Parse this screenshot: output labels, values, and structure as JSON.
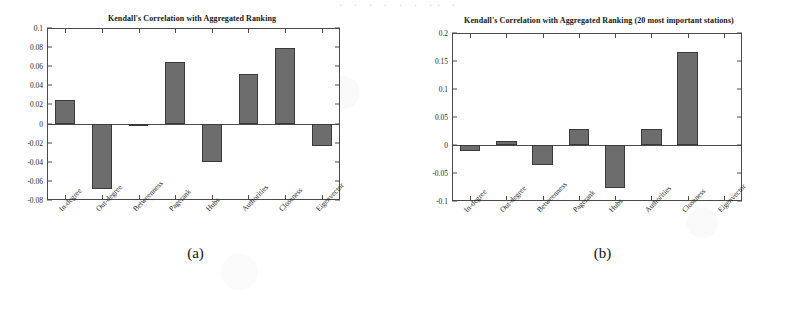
{
  "page": {
    "top_bleed_text": "· · ·  · ·   ·  ·· ·",
    "bar_color": "#6d6d6d",
    "axis_color": "#4a4a4a"
  },
  "panels": [
    {
      "caption": "(a)",
      "chart_data": {
        "type": "bar",
        "title": "Kendall's Correlation with Aggregated Ranking",
        "xlabel": "",
        "ylabel": "",
        "ylim": [
          -0.08,
          0.1
        ],
        "yticks": [
          0.1,
          0.08,
          0.06,
          0.04,
          0.02,
          0,
          -0.02,
          -0.04,
          -0.06,
          -0.08
        ],
        "ytick_labels": [
          "0.1",
          "0.08",
          "0.06",
          "0.04",
          "0.02",
          "0",
          "-0.02",
          "-0.04",
          "-0.06",
          "-0.08"
        ],
        "grid": false,
        "legend": "none",
        "categories": [
          "In-degree",
          "Out-degree",
          "Betweenness",
          "Pagerank",
          "Hubs",
          "Authorities",
          "Closeness",
          "Eigenvector"
        ],
        "values": [
          0.025,
          -0.069,
          -0.0005,
          0.064,
          -0.04,
          0.052,
          0.079,
          -0.024
        ]
      }
    },
    {
      "caption": "(b)",
      "chart_data": {
        "type": "bar",
        "title": "Kendall's Correlation with Aggregated Ranking (20 most important stations)",
        "xlabel": "",
        "ylabel": "",
        "ylim": [
          -0.1,
          0.2
        ],
        "yticks": [
          0.2,
          0.15,
          0.1,
          0.05,
          0,
          -0.05,
          -0.1
        ],
        "ytick_labels": [
          "0.2",
          "0.15",
          "0.1",
          "0.05",
          "0",
          "-0.05",
          "-0.1"
        ],
        "grid": false,
        "legend": "none",
        "categories": [
          "In-degree",
          "Out-degree",
          "Betweenness",
          "Pagerank",
          "Hubs",
          "Authorities",
          "Closeness",
          "Eigenvector"
        ],
        "values": [
          -0.01,
          0.008,
          -0.036,
          0.028,
          -0.077,
          0.028,
          0.166,
          0.0
        ]
      }
    }
  ]
}
